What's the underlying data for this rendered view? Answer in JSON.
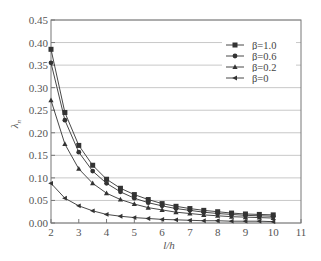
{
  "chart_data": {
    "type": "line",
    "title": "",
    "xlabel": "l/h",
    "ylabel": "λn",
    "xlim": [
      2,
      11
    ],
    "ylim": [
      0,
      0.45
    ],
    "xticks": [
      "2",
      "3",
      "4",
      "5",
      "6",
      "7",
      "8",
      "9",
      "10",
      "11"
    ],
    "yticks": [
      "0.00",
      "0.05",
      "0.10",
      "0.15",
      "0.20",
      "0.25",
      "0.30",
      "0.35",
      "0.40",
      "0.45"
    ],
    "grid": "horizontal",
    "legend_position": "upper right",
    "x": [
      2,
      2.5,
      3,
      3.5,
      4,
      4.5,
      5,
      5.5,
      6,
      6.5,
      7,
      7.5,
      8,
      8.5,
      9,
      9.5,
      10
    ],
    "series": [
      {
        "name": "β=1.0",
        "marker": "square",
        "values": [
          0.385,
          0.245,
          0.172,
          0.128,
          0.097,
          0.077,
          0.063,
          0.052,
          0.043,
          0.037,
          0.032,
          0.028,
          0.025,
          0.022,
          0.02,
          0.019,
          0.018
        ]
      },
      {
        "name": "β=0.6",
        "marker": "circle",
        "values": [
          0.355,
          0.228,
          0.157,
          0.115,
          0.088,
          0.069,
          0.055,
          0.045,
          0.038,
          0.032,
          0.028,
          0.024,
          0.021,
          0.019,
          0.017,
          0.016,
          0.015
        ]
      },
      {
        "name": "β=0.2",
        "marker": "triangle",
        "values": [
          0.272,
          0.175,
          0.12,
          0.088,
          0.066,
          0.052,
          0.042,
          0.034,
          0.029,
          0.024,
          0.021,
          0.018,
          0.016,
          0.014,
          0.013,
          0.012,
          0.011
        ]
      },
      {
        "name": "β=0",
        "marker": "left-triangle",
        "values": [
          0.088,
          0.055,
          0.038,
          0.027,
          0.019,
          0.015,
          0.012,
          0.01,
          0.008,
          0.007,
          0.006,
          0.005,
          0.005,
          0.004,
          0.004,
          0.004,
          0.003
        ]
      }
    ]
  },
  "legend": {
    "items": [
      {
        "label": "β=1.0"
      },
      {
        "label": "β=0.6"
      },
      {
        "label": "β=0.2"
      },
      {
        "label": "β=0"
      }
    ]
  },
  "axes": {
    "xlabel": "l/h",
    "ylabel_main": "λ",
    "ylabel_sub": "n"
  },
  "colors": {
    "line": "#333333",
    "grid": "#c8c8c8",
    "frame": "#777777"
  }
}
